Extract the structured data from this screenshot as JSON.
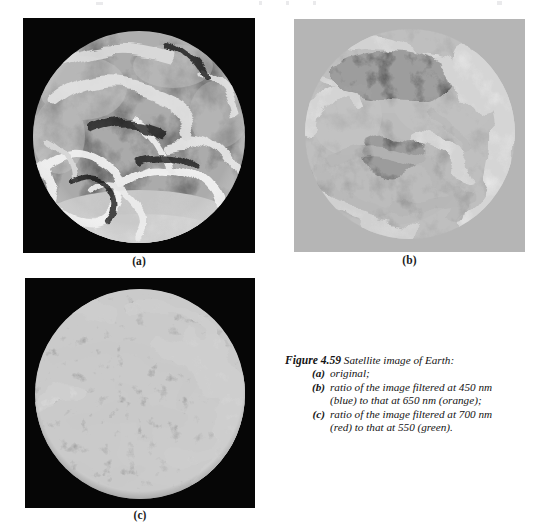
{
  "figure": {
    "number": "Figure 4.59",
    "lead_text": "Satellite image of Earth:",
    "panels": [
      {
        "id": "a",
        "label": "(a)",
        "marker": "(a)",
        "description": "original;",
        "background": "#050505",
        "kind": "grayscale-earth-original"
      },
      {
        "id": "b",
        "label": "(b)",
        "marker": "(b)",
        "description": "ratio of the image filtered at 450 nm",
        "description_cont": "(blue) to that at 650 nm (orange);",
        "background": "#b4b4b4",
        "kind": "ratio-450-650"
      },
      {
        "id": "c",
        "label": "(c)",
        "marker": "(c)",
        "description": "ratio of the image filtered at 700 nm",
        "description_cont": "(red) to that at 550 (green).",
        "background": "#050505",
        "kind": "ratio-700-550"
      }
    ]
  },
  "colors": {
    "page_background": "#ffffff",
    "panel_a_background": "#050505",
    "panel_b_background": "#b4b4b4",
    "panel_c_background": "#050505",
    "caption_text": "#141414"
  }
}
